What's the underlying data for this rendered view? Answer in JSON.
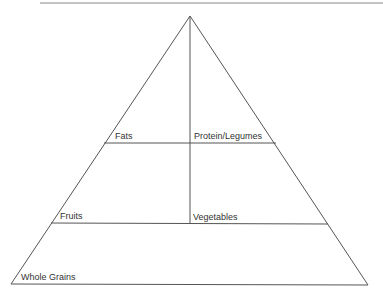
{
  "diagram": {
    "type": "food-pyramid",
    "labels": {
      "fats": "Fats",
      "protein": "Protein/Legumes",
      "fruits": "Fruits",
      "vegetables": "Vegetables",
      "grains": "Whole Grains"
    },
    "line_color": "#555555"
  }
}
